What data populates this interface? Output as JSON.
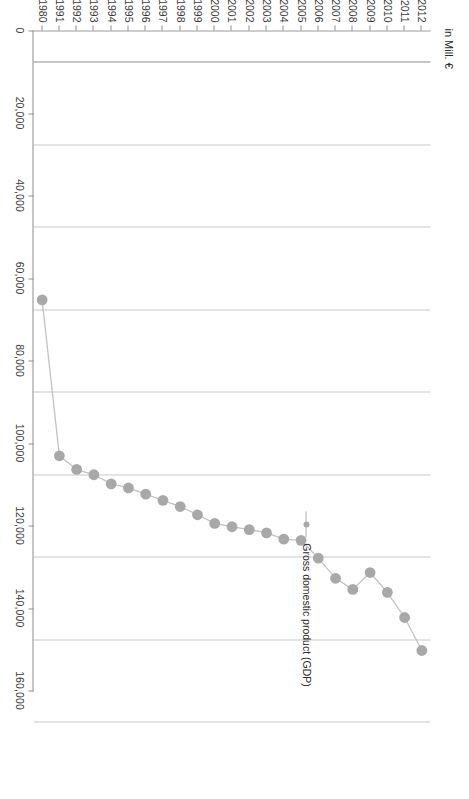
{
  "chart_data": {
    "type": "line",
    "title": "",
    "xlabel": "",
    "ylabel": "in Mill. €",
    "orientation": "rotated-90",
    "grid": true,
    "legend_position": "inside-right",
    "categories": [
      "1980",
      "1991",
      "1992",
      "1993",
      "1994",
      "1995",
      "1996",
      "1997",
      "1998",
      "1999",
      "2000",
      "2001",
      "2002",
      "2003",
      "2004",
      "2005",
      "2006",
      "2007",
      "2008",
      "2009",
      "2010",
      "2011",
      "2012"
    ],
    "series": [
      {
        "name": "Gross domestic product (GDP)",
        "values": [
          65300,
          103100,
          106400,
          107700,
          109900,
          110900,
          112400,
          113900,
          115400,
          117400,
          119500,
          120300,
          121000,
          121800,
          123300,
          123600,
          127900,
          132800,
          135500,
          131400,
          136200,
          142300,
          150300
        ]
      }
    ],
    "value_axis": {
      "label": "in Mill. €",
      "min": 0,
      "max": 160000,
      "ticks": [
        0,
        20000,
        40000,
        60000,
        80000,
        100000,
        120000,
        140000,
        160000
      ],
      "tick_labels": [
        "0",
        "20,000",
        "40,000",
        "60,000",
        "80,000",
        "100,000",
        "120,000",
        "140,000",
        "160,000"
      ]
    },
    "colors": {
      "marker": "#a8a8a8",
      "line": "#c2c2c2",
      "grid": "#c9c9c9",
      "axis": "#8e8e8e",
      "text": "#3a3a3a"
    }
  },
  "legend": {
    "items": [
      {
        "label": "Gross domestic product (GDP)",
        "marker": "circle-marker"
      }
    ]
  }
}
